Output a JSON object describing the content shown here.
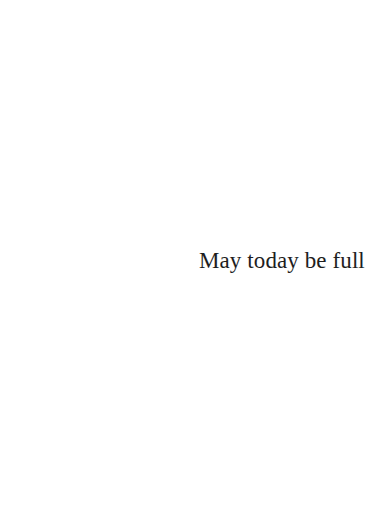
{
  "page": {
    "background": "#ffffff",
    "text": "May today be full",
    "text_color": "#1e1e1e"
  }
}
